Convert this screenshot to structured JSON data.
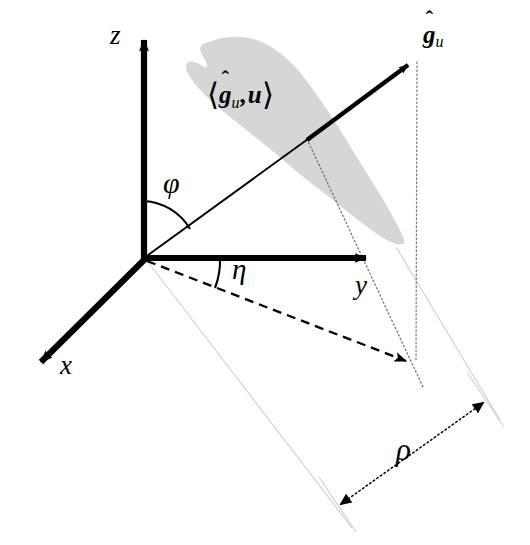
{
  "figure": {
    "type": "3d-coordinate-diagram",
    "background_color": "#ffffff",
    "line_color": "#000000",
    "region_fill_color": "#d6d6d6",
    "faint_line_color": "#cfcfcf"
  },
  "axes": [
    {
      "name": "x-axis",
      "label": "x",
      "direction": "down-left",
      "origin": [
        144,
        258
      ],
      "tip": [
        33,
        369
      ],
      "style": "solid-thick-arrow"
    },
    {
      "name": "y-axis",
      "label": "y",
      "direction": "right",
      "origin": [
        144,
        258
      ],
      "tip": [
        376,
        258
      ],
      "style": "solid-thick-arrow"
    },
    {
      "name": "z-axis",
      "label": "z",
      "direction": "up",
      "origin": [
        144,
        258
      ],
      "tip": [
        144,
        32
      ],
      "style": "solid-thick-arrow"
    }
  ],
  "vector": {
    "name": "g-hat-u",
    "label": "ĝ",
    "label_hat": "ˆ",
    "label_base": "g",
    "label_subscript": "u",
    "tail": [
      144,
      258
    ],
    "tip": [
      417,
      57
    ],
    "thin_segment_end": [
      307,
      139
    ],
    "style": "thin-line-then-thick-arrow"
  },
  "region": {
    "name": "inner-product-region",
    "label_open_bracket": "⟨",
    "label_close_bracket": "⟩",
    "label_first_symbol": "g",
    "label_first_hat": "ˆ",
    "label_first_subscript": "u",
    "label_comma": ",",
    "label_second_symbol": "u",
    "label_full": "⟨ĝᵤ, u⟩",
    "fill": "#d6d6d6",
    "shape": "elongated-amoeba-blob"
  },
  "angles": [
    {
      "name": "phi-angle",
      "label": "φ",
      "description": "polar angle from z-axis to vector",
      "arc_radius": 57,
      "vertex": [
        144,
        258
      ],
      "from_axis": "z",
      "to": "g-hat-u"
    },
    {
      "name": "eta-angle",
      "label": "η",
      "description": "azimuthal angle from y-axis to projection",
      "arc_radius": 76,
      "vertex": [
        144,
        258
      ],
      "from_axis": "y",
      "to": "projection"
    }
  ],
  "projection": {
    "name": "projection-arrow",
    "style": "dashed-arrow",
    "tail": [
      144,
      258
    ],
    "tip": [
      416,
      364
    ]
  },
  "dimension": {
    "name": "rho-dimension",
    "label": "ρ",
    "style": "dotted-double-headed-arrow",
    "tip_lower_left": [
      338,
      506
    ],
    "tip_upper_right": [
      486,
      401
    ]
  },
  "guide_lines": [
    {
      "name": "vertical-dotted-drop",
      "style": "dotted",
      "from": [
        417,
        62
      ],
      "to": [
        416,
        364
      ]
    },
    {
      "name": "vector-to-baseline-dotted",
      "style": "dotted",
      "from": [
        307,
        139
      ],
      "to": [
        422,
        384
      ]
    },
    {
      "name": "faint-ray-left",
      "style": "faint-solid",
      "from": [
        148,
        262
      ],
      "to": [
        352,
        528
      ]
    },
    {
      "name": "faint-ray-right",
      "style": "faint-solid",
      "from": [
        395,
        248
      ],
      "to": [
        500,
        420
      ]
    },
    {
      "name": "rho-extension-lower",
      "style": "faint-solid",
      "from": [
        320,
        478
      ],
      "to": [
        355,
        531
      ]
    },
    {
      "name": "rho-extension-upper",
      "style": "faint-solid",
      "from": [
        468,
        373
      ],
      "to": [
        503,
        426
      ]
    }
  ]
}
